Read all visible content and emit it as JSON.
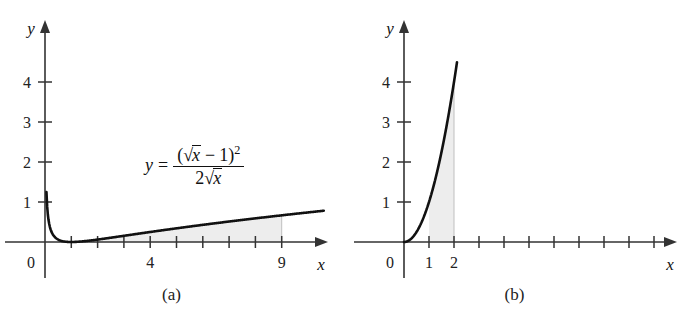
{
  "figure": {
    "background_color": "#ffffff",
    "curve_color": "#111111",
    "axis_color": "#333333",
    "shade_color": "#ededed",
    "shade_border_color": "#bfbfbf"
  },
  "panels": [
    {
      "id": "a",
      "caption": "(a)",
      "x_axis_name": "x",
      "y_axis_name": "y",
      "origin_label": "0",
      "formula": {
        "lhs_y": "y",
        "equals": "=",
        "numerator": {
          "open_paren": "(",
          "radical": "√",
          "radicand": "x",
          "minus": "−",
          "one": "1",
          "close_paren": ")",
          "exponent": "2"
        },
        "denominator": {
          "two": "2",
          "radical": "√",
          "radicand": "x"
        }
      },
      "x_ticks": [
        {
          "value": 1,
          "label": ""
        },
        {
          "value": 2,
          "label": ""
        },
        {
          "value": 3,
          "label": ""
        },
        {
          "value": 4,
          "label": "4"
        },
        {
          "value": 5,
          "label": ""
        },
        {
          "value": 6,
          "label": ""
        },
        {
          "value": 7,
          "label": ""
        },
        {
          "value": 8,
          "label": ""
        },
        {
          "value": 9,
          "label": "9"
        }
      ],
      "y_ticks": [
        {
          "value": 1,
          "label": "1"
        },
        {
          "value": 2,
          "label": "2"
        },
        {
          "value": 3,
          "label": "3"
        },
        {
          "value": 4,
          "label": "4"
        }
      ],
      "shaded_from": 1,
      "shaded_to": 9
    },
    {
      "id": "b",
      "caption": "(b)",
      "x_axis_name": "x",
      "y_axis_name": "y",
      "origin_label": "0",
      "formula": {
        "lhs_y": "y",
        "equals": "=",
        "base": "x",
        "exponent": "2"
      },
      "x_ticks": [
        {
          "value": 1,
          "label": "1"
        },
        {
          "value": 2,
          "label": "2"
        },
        {
          "value": 3,
          "label": ""
        },
        {
          "value": 4,
          "label": ""
        },
        {
          "value": 5,
          "label": ""
        },
        {
          "value": 6,
          "label": ""
        },
        {
          "value": 7,
          "label": ""
        },
        {
          "value": 8,
          "label": ""
        },
        {
          "value": 9,
          "label": ""
        },
        {
          "value": 10,
          "label": ""
        }
      ],
      "y_ticks": [
        {
          "value": 1,
          "label": "1"
        },
        {
          "value": 2,
          "label": "2"
        },
        {
          "value": 3,
          "label": "3"
        },
        {
          "value": 4,
          "label": "4"
        }
      ],
      "shaded_from": 1,
      "shaded_to": 2
    }
  ],
  "chart_data": [
    {
      "type": "line",
      "panel": "a",
      "title": "",
      "xlabel": "x",
      "ylabel": "y",
      "equation": "y = (sqrt(x) - 1)^2 / (2*sqrt(x))",
      "xlim": [
        0,
        10.7
      ],
      "ylim": [
        0,
        4.8
      ],
      "grid": false,
      "legend": "none",
      "annotations": [
        "y = (√x − 1)² / (2√x)"
      ],
      "xticks": [
        1,
        2,
        3,
        4,
        5,
        6,
        7,
        8,
        9
      ],
      "xticklabels": [
        "",
        "",
        "",
        "4",
        "",
        "",
        "",
        "",
        "9"
      ],
      "yticks": [
        1,
        2,
        3,
        4
      ],
      "yticklabels": [
        "1",
        "2",
        "3",
        "4"
      ],
      "shaded_region": {
        "x_from": 1,
        "x_to": 9,
        "under_curve": true
      },
      "x": [
        0.06,
        0.1,
        0.15,
        0.2,
        0.3,
        0.4,
        0.5,
        0.6,
        0.8,
        1.0,
        1.5,
        2.0,
        3.0,
        4.0,
        5.0,
        6.0,
        7.0,
        8.0,
        9.0,
        10.0,
        10.6
      ],
      "y": [
        1.13,
        0.78,
        0.55,
        0.42,
        0.27,
        0.18,
        0.13,
        0.08,
        0.006,
        0.0,
        0.021,
        0.061,
        0.154,
        0.25,
        0.341,
        0.427,
        0.508,
        0.586,
        0.667,
        0.738,
        0.777
      ]
    },
    {
      "type": "line",
      "panel": "b",
      "title": "",
      "xlabel": "x",
      "ylabel": "y",
      "equation": "y = x^2",
      "xlim": [
        0,
        11.2
      ],
      "ylim": [
        0,
        4.8
      ],
      "grid": false,
      "legend": "none",
      "annotations": [
        "y = x²"
      ],
      "xticks": [
        1,
        2,
        3,
        4,
        5,
        6,
        7,
        8,
        9,
        10
      ],
      "xticklabels": [
        "1",
        "2",
        "",
        "",
        "",
        "",
        "",
        "",
        "",
        ""
      ],
      "yticks": [
        1,
        2,
        3,
        4
      ],
      "yticklabels": [
        "1",
        "2",
        "3",
        "4"
      ],
      "shaded_region": {
        "x_from": 1,
        "x_to": 2,
        "under_curve": true
      },
      "x": [
        0,
        0.2,
        0.4,
        0.6,
        0.8,
        1.0,
        1.2,
        1.4,
        1.6,
        1.8,
        2.0,
        2.1
      ],
      "y": [
        0,
        0.04,
        0.16,
        0.36,
        0.64,
        1.0,
        1.44,
        1.96,
        2.56,
        3.24,
        4.0,
        4.41
      ]
    }
  ]
}
